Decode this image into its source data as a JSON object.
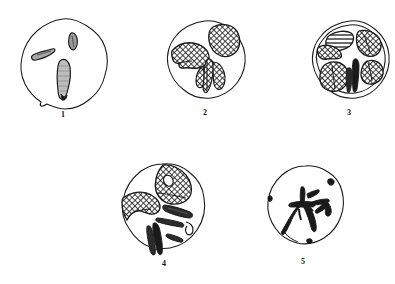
{
  "plate": {
    "title": "",
    "background_color": "#ffffff",
    "ink_color": "#1a1a1a",
    "figure_count": 5,
    "description": "Scientific line-drawing plate of five rounded specimen outlines with cross-hatched and solid-black internal markings, each labelled with a numeral beneath."
  },
  "figures": [
    {
      "id": "figure-1",
      "label": "1",
      "row": 1,
      "column": 1,
      "outline_shape": "irregular-circle",
      "outline_cx": 63,
      "outline_cy": 62,
      "outline_rx": 45,
      "outline_ry": 45,
      "hatched_region_count": 0,
      "solid_marking_count": 3,
      "marking_note": "three small elongate slit-like bodies, lightly stippled",
      "label_x": 43,
      "label_y": 110
    },
    {
      "id": "figure-2",
      "label": "2",
      "row": 1,
      "column": 2,
      "outline_shape": "irregular-circle",
      "outline_cx": 205,
      "outline_cy": 59,
      "outline_rx": 38,
      "outline_ry": 38,
      "hatched_region_count": 3,
      "solid_marking_count": 1,
      "marking_note": "two large cross-hatched lobes upper-left and upper-right plus a central V-shaped hatched body",
      "label_x": 185,
      "label_y": 108
    },
    {
      "id": "figure-3",
      "label": "3",
      "row": 1,
      "column": 3,
      "outline_shape": "irregular-circle",
      "outline_cx": 349,
      "outline_cy": 59,
      "outline_rx": 37,
      "outline_ry": 37,
      "hatched_region_count": 6,
      "solid_marking_count": 2,
      "marking_note": "six cross-hatched plates arranged radially around a pale central star with two dark bars at bottom centre",
      "label_x": 329,
      "label_y": 108
    },
    {
      "id": "figure-4",
      "label": "4",
      "row": 2,
      "column": 1,
      "outline_shape": "irregular-circle",
      "outline_cx": 164,
      "outline_cy": 207,
      "outline_rx": 42,
      "outline_ry": 44,
      "hatched_region_count": 2,
      "solid_marking_count": 5,
      "marking_note": "large cross-hatched lobe at top with small white eyelet, second hatched lobe at left, several solid dark bars across the lower half",
      "label_x": 144,
      "label_y": 259
    },
    {
      "id": "figure-5",
      "label": "5",
      "row": 2,
      "column": 2,
      "outline_shape": "irregular-circle",
      "outline_cx": 303,
      "outline_cy": 205,
      "outline_rx": 38,
      "outline_ry": 40,
      "hatched_region_count": 0,
      "solid_marking_count": 1,
      "marking_note": "single solid-black branching stellate figure near the centre with three small dark nodules on the rim",
      "label_x": 283,
      "label_y": 257
    }
  ]
}
